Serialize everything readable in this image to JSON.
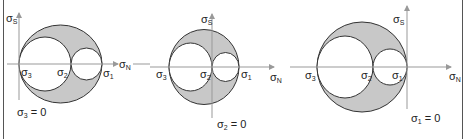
{
  "colors": {
    "fill": "#c8c8c8",
    "stroke": "#333333",
    "axis": "#999999",
    "inner": "#ffffff"
  },
  "panels": [
    {
      "condition": "σ3 = 0",
      "condition_sym": "σ",
      "condition_sub": "3",
      "condition_rest": " = 0",
      "axis_v_label": {
        "sym": "σ",
        "sub": "S"
      },
      "axis_h_label": {
        "sym": "σ",
        "sub": "N"
      },
      "points": [
        {
          "sym": "σ",
          "sub": "3"
        },
        {
          "sym": "σ",
          "sub": "2"
        },
        {
          "sym": "σ",
          "sub": "1"
        }
      ]
    },
    {
      "condition": "σ2 = 0",
      "condition_sym": "σ",
      "condition_sub": "2",
      "condition_rest": " = 0",
      "axis_v_label": {
        "sym": "σ",
        "sub": "S"
      },
      "axis_h_label": {
        "sym": "σ",
        "sub": "N"
      },
      "points": [
        {
          "sym": "σ",
          "sub": "3"
        },
        {
          "sym": "σ",
          "sub": "2"
        },
        {
          "sym": "σ",
          "sub": "1"
        }
      ]
    },
    {
      "condition": "σ1 = 0",
      "condition_sym": "σ",
      "condition_sub": "1",
      "condition_rest": " = 0",
      "axis_v_label": {
        "sym": "σ",
        "sub": "S"
      },
      "axis_h_label": {
        "sym": "σ",
        "sub": "N"
      },
      "points": [
        {
          "sym": "σ",
          "sub": "3"
        },
        {
          "sym": "σ",
          "sub": "2"
        },
        {
          "sym": "σ",
          "sub": "1"
        }
      ]
    }
  ]
}
